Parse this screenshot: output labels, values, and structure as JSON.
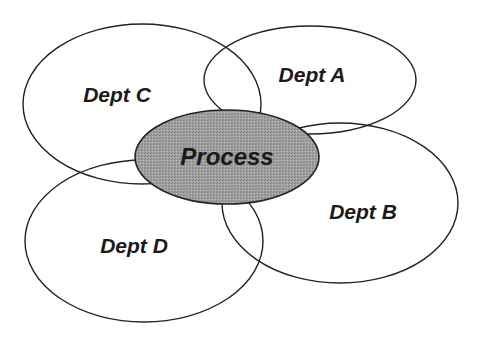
{
  "diagram": {
    "type": "overlapping-ellipses",
    "center": {
      "label": "Process",
      "fill": "#9a9a9a",
      "cx": 227,
      "cy": 157,
      "rx": 92,
      "ry": 47
    },
    "departments": [
      {
        "label": "Dept A",
        "cx": 310,
        "cy": 80,
        "rx": 106,
        "ry": 54,
        "tx": 312,
        "ty": 82
      },
      {
        "label": "Dept B",
        "cx": 340,
        "cy": 203,
        "rx": 118,
        "ry": 80,
        "tx": 363,
        "ty": 219
      },
      {
        "label": "Dept C",
        "cx": 142,
        "cy": 104,
        "rx": 119,
        "ry": 80,
        "tx": 117,
        "ty": 102
      },
      {
        "label": "Dept D",
        "cx": 144,
        "cy": 241,
        "rx": 119,
        "ry": 81,
        "tx": 134,
        "ty": 253
      }
    ],
    "stroke": "#222222"
  }
}
